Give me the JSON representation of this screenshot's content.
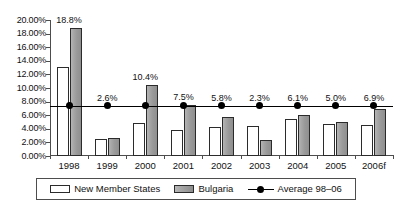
{
  "chart_data": {
    "type": "bar",
    "title": "",
    "subtitle": "",
    "xlabel": "",
    "ylabel": "",
    "ylim": [
      0,
      20
    ],
    "grid": false,
    "legend_position": "bottom",
    "categories": [
      "1998",
      "1999",
      "2000",
      "2001",
      "2002",
      "2003",
      "2004",
      "2005",
      "2006f"
    ],
    "ytick_labels": [
      "0.00%",
      "2.00%",
      "4.00%",
      "6.00%",
      "8.00%",
      "10.00%",
      "12.00%",
      "14.00%",
      "16.00%",
      "18.00%",
      "20.00%"
    ],
    "ytick_values": [
      0,
      2,
      4,
      6,
      8,
      10,
      12,
      14,
      16,
      18,
      20
    ],
    "series": [
      {
        "name": "New Member States",
        "type": "bar",
        "color": "#ffffff",
        "values": [
          13.1,
          2.5,
          4.8,
          3.8,
          4.2,
          4.4,
          5.5,
          4.7,
          4.5
        ]
      },
      {
        "name": "Bulgaria",
        "type": "bar",
        "color": "#9e9e9e",
        "values": [
          18.8,
          2.6,
          10.4,
          7.5,
          5.8,
          2.3,
          6.1,
          5.0,
          6.9
        ]
      },
      {
        "name": "Average 98–06",
        "type": "line",
        "color": "#000000",
        "values": [
          7.4,
          7.4,
          7.4,
          7.4,
          7.4,
          7.4,
          7.4,
          7.4,
          7.4
        ]
      }
    ],
    "data_labels": [
      "18.8%",
      "2.6%",
      "10.4%",
      "7.5%",
      "5.8%",
      "2.3%",
      "6.1%",
      "5.0%",
      "6.9%"
    ]
  },
  "legend": {
    "items": [
      {
        "label": "New Member States",
        "marker": "white-square-swatch"
      },
      {
        "label": "Bulgaria",
        "marker": "gray-square-swatch"
      },
      {
        "label": "Average 98–06",
        "marker": "line-with-dot-marker"
      }
    ]
  }
}
